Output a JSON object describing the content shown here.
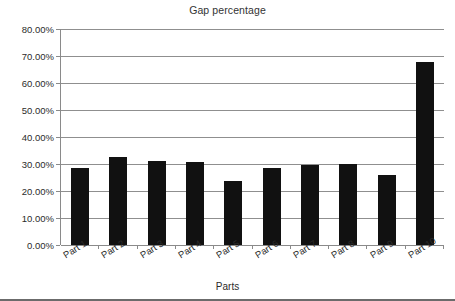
{
  "chart_data": {
    "type": "bar",
    "title": "Gap percentage",
    "xlabel": "Parts",
    "ylabel": "",
    "categories": [
      "Part 1",
      "Part 2",
      "Part 3",
      "Part 4",
      "Part 5",
      "Part 6",
      "Part 7",
      "Part 8",
      "Part 9",
      "Part 10"
    ],
    "values": [
      28.5,
      32.5,
      31.1,
      30.9,
      23.6,
      28.7,
      29.7,
      30.1,
      26.0,
      67.7
    ],
    "value_labels": [
      "28.50%",
      "32.50%",
      "31.10%",
      "30.90%",
      "23.60%",
      "28.70%",
      "29.70%",
      "30.10%",
      "26.00%",
      "67.70%"
    ],
    "ylim": [
      0,
      80
    ],
    "ytick_values": [
      0,
      10,
      20,
      30,
      40,
      50,
      60,
      70,
      80
    ],
    "ytick_labels": [
      "0.00%",
      "10.00%",
      "20.00%",
      "30.00%",
      "40.00%",
      "50.00%",
      "60.00%",
      "70.00%",
      "80.00%"
    ],
    "grid": "horizontal",
    "legend": "none",
    "series_color": "#111111",
    "gridline_color": "#8f8f8f",
    "axis_color": "#8a8a8a",
    "background_color": "#ffffff",
    "xtick_label_rotation": -32
  }
}
